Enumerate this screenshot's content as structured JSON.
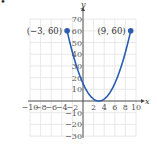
{
  "bullet": "•",
  "chart_data": {
    "type": "line",
    "title": "",
    "xlabel": "x",
    "ylabel": "y",
    "xlim": [
      -10,
      10
    ],
    "ylim": [
      -30,
      70
    ],
    "grid": true,
    "x_ticks": [
      -10,
      -8,
      -6,
      -4,
      -2,
      2,
      4,
      6,
      8,
      10
    ],
    "y_ticks": [
      -30,
      -20,
      -10,
      10,
      20,
      30,
      40,
      50,
      60,
      70
    ],
    "x_tick_labels": [
      "−10",
      "−8",
      "−6",
      "−4",
      "−2",
      "2",
      "4",
      "6",
      "8",
      "10"
    ],
    "y_tick_labels": [
      "−30",
      "−20",
      "−10",
      "10",
      "20",
      "30",
      "40",
      "50",
      "60",
      "70"
    ],
    "series": [
      {
        "name": "parabola",
        "equation": "y = (5/3)(x - 3)^2",
        "domain": [
          -3,
          9
        ],
        "x": [
          -3,
          -2,
          -1,
          0,
          1,
          2,
          3,
          4,
          5,
          6,
          7,
          8,
          9
        ],
        "y": [
          60,
          41.7,
          26.7,
          15,
          6.7,
          1.7,
          0,
          1.7,
          6.7,
          15,
          26.7,
          41.7,
          60
        ],
        "color": "#2a5db0"
      }
    ],
    "annotations": [
      {
        "point": [
          -3,
          60
        ],
        "text": "(−3, 60)",
        "marker": "filled-circle"
      },
      {
        "point": [
          9,
          60
        ],
        "text": "(9, 60)",
        "marker": "filled-circle"
      }
    ]
  }
}
